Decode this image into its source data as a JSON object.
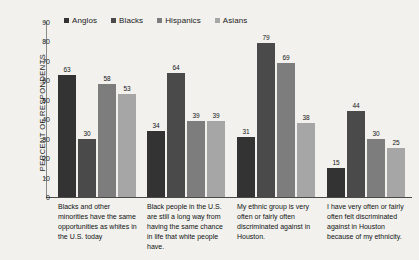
{
  "chart_data": {
    "type": "bar",
    "title": "",
    "xlabel": "",
    "ylabel": "PERCENT OF RESPONDENTS",
    "ylim": [
      0,
      90
    ],
    "yticks": [
      0,
      10,
      20,
      30,
      40,
      50,
      60,
      70,
      80,
      90
    ],
    "grid": false,
    "legend_position": "top",
    "categories": [
      "Blacks and other minorities have the same opportunities as whites in the U.S. today",
      "Black people in the U.S. are still a long way from having the same chance in life that white people have.",
      "My ethnic group is very often or fairly often discriminated against in Houston.",
      "I have very often or fairly often felt discriminated against in Houston because of my ethnicity."
    ],
    "series": [
      {
        "name": "Anglos",
        "color": "#333333",
        "values": [
          63,
          34,
          31,
          15
        ]
      },
      {
        "name": "Blacks",
        "color": "#4a4a4a",
        "values": [
          30,
          64,
          79,
          44
        ]
      },
      {
        "name": "Hispanics",
        "color": "#7d7d7d",
        "values": [
          58,
          39,
          69,
          30
        ]
      },
      {
        "name": "Asians",
        "color": "#a6a6a6",
        "values": [
          53,
          39,
          38,
          25
        ]
      }
    ]
  }
}
